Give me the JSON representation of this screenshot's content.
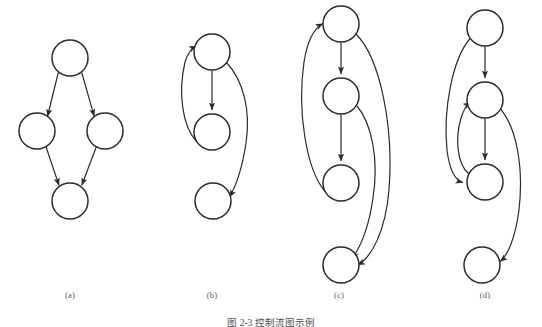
{
  "figure": {
    "caption": "图 2-3 控制流图示例",
    "stroke_color": "#2b2b2b",
    "node_fill": "#ffffff",
    "label_color": "#5a5a5a",
    "background": "#ffffff",
    "node_radius": 18,
    "stroke_width": 1.4
  },
  "panels": [
    {
      "id": "a",
      "label": "(a)",
      "label_x": 70,
      "label_y": 296,
      "node_count": 4,
      "nodes": [
        {
          "id": "a1",
          "cx": 70,
          "cy": 58,
          "r": 18
        },
        {
          "id": "a2",
          "cx": 37,
          "cy": 131,
          "r": 18
        },
        {
          "id": "a3",
          "cx": 105,
          "cy": 131,
          "r": 18
        },
        {
          "id": "a4",
          "cx": 70,
          "cy": 201,
          "r": 18
        }
      ],
      "edges": [
        {
          "from": "a1",
          "to": "a2",
          "kind": "straight"
        },
        {
          "from": "a1",
          "to": "a3",
          "kind": "straight"
        },
        {
          "from": "a2",
          "to": "a4",
          "kind": "straight"
        },
        {
          "from": "a3",
          "to": "a4",
          "kind": "straight"
        }
      ]
    },
    {
      "id": "b",
      "label": "(b)",
      "label_x": 212,
      "label_y": 296,
      "node_count": 3,
      "nodes": [
        {
          "id": "b1",
          "cx": 212,
          "cy": 52,
          "r": 18
        },
        {
          "id": "b2",
          "cx": 212,
          "cy": 132,
          "r": 18
        },
        {
          "id": "b3",
          "cx": 213,
          "cy": 201,
          "r": 18
        }
      ],
      "edges": [
        {
          "from": "b1",
          "to": "b2",
          "kind": "straight"
        },
        {
          "from": "b2",
          "to": "b1",
          "kind": "curve-left-back"
        },
        {
          "from": "b1",
          "to": "b3",
          "kind": "curve-right-forward"
        }
      ]
    },
    {
      "id": "c",
      "label": "(c)",
      "label_x": 339,
      "label_y": 296,
      "node_count": 4,
      "nodes": [
        {
          "id": "c1",
          "cx": 341,
          "cy": 24,
          "r": 18
        },
        {
          "id": "c2",
          "cx": 341,
          "cy": 96,
          "r": 18
        },
        {
          "id": "c3",
          "cx": 341,
          "cy": 183,
          "r": 18
        },
        {
          "id": "c4",
          "cx": 341,
          "cy": 265,
          "r": 18
        }
      ],
      "edges": [
        {
          "from": "c1",
          "to": "c2",
          "kind": "straight"
        },
        {
          "from": "c2",
          "to": "c3",
          "kind": "straight"
        },
        {
          "from": "c3",
          "to": "c1",
          "kind": "curve-left-back"
        },
        {
          "from": "c2",
          "to": "c4",
          "kind": "curve-right-forward"
        },
        {
          "from": "c1",
          "to": "c4",
          "kind": "curve-right-forward-wide"
        }
      ]
    },
    {
      "id": "d",
      "label": "(d)",
      "label_x": 485,
      "label_y": 296,
      "node_count": 4,
      "nodes": [
        {
          "id": "d1",
          "cx": 485,
          "cy": 28,
          "r": 18
        },
        {
          "id": "d2",
          "cx": 485,
          "cy": 100,
          "r": 18
        },
        {
          "id": "d3",
          "cx": 485,
          "cy": 182,
          "r": 18
        },
        {
          "id": "d4",
          "cx": 482,
          "cy": 265,
          "r": 18
        }
      ],
      "edges": [
        {
          "from": "d1",
          "to": "d2",
          "kind": "straight"
        },
        {
          "from": "d2",
          "to": "d3",
          "kind": "straight"
        },
        {
          "from": "d1",
          "to": "d3",
          "kind": "curve-left-forward"
        },
        {
          "from": "d3",
          "to": "d2",
          "kind": "curve-left-back"
        },
        {
          "from": "d2",
          "to": "d4",
          "kind": "curve-right-forward"
        }
      ]
    }
  ]
}
